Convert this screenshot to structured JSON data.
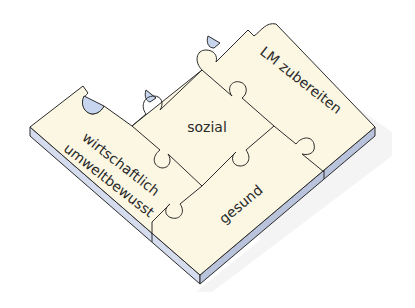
{
  "diagram": {
    "type": "isometric-puzzle",
    "pieces": [
      {
        "id": "sozial",
        "label": "sozial",
        "position": "center"
      },
      {
        "id": "lm-zubereiten",
        "label": "LM zubereiten",
        "position": "top-right"
      },
      {
        "id": "wirtschaftlich-umweltbewusst",
        "label_line1": "wirtschaftlich",
        "label_line2": "umweltbewusst",
        "position": "left"
      },
      {
        "id": "gesund",
        "label": "gesund",
        "position": "bottom-right"
      }
    ],
    "colors": {
      "top_face": "#fbf7e3",
      "side_face": "#d4dcee",
      "side_face_dark": "#b9c3dc",
      "outline": "#2b2b2b",
      "shadow": "#e6e6e6"
    }
  }
}
